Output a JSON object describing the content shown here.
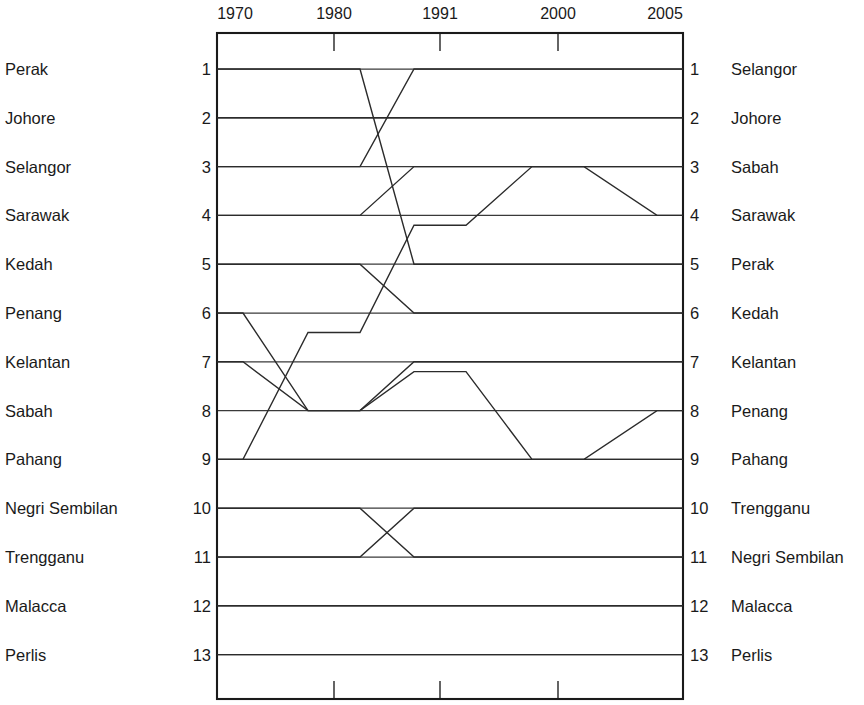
{
  "chart_data": {
    "type": "line",
    "subtype": "bump-rank-slopegraph",
    "title": "",
    "xlabel": "",
    "ylabel": "",
    "grid": true,
    "legend_position": "axis-labels-both-sides",
    "x": [
      1970,
      1980,
      1991,
      2000,
      2005
    ],
    "x_tick_labels": [
      "1970",
      "1980",
      "1991",
      "2000",
      "2005"
    ],
    "y_axis_inverted": true,
    "ylim": [
      1,
      13
    ],
    "rank_ticks": [
      1,
      2,
      3,
      4,
      5,
      6,
      7,
      8,
      9,
      10,
      11,
      12,
      13
    ],
    "left_axis": {
      "header": "",
      "entries": [
        {
          "rank": "1",
          "label": "Perak"
        },
        {
          "rank": "2",
          "label": "Johore"
        },
        {
          "rank": "3",
          "label": "Selangor"
        },
        {
          "rank": "4",
          "label": "Sarawak"
        },
        {
          "rank": "5",
          "label": "Kedah"
        },
        {
          "rank": "6",
          "label": "Penang"
        },
        {
          "rank": "7",
          "label": "Kelantan"
        },
        {
          "rank": "8",
          "label": "Sabah"
        },
        {
          "rank": "9",
          "label": "Pahang"
        },
        {
          "rank": "10",
          "label": "Negri Sembilan"
        },
        {
          "rank": "11",
          "label": "Trengganu"
        },
        {
          "rank": "12",
          "label": "Malacca"
        },
        {
          "rank": "13",
          "label": "Perlis"
        }
      ]
    },
    "right_axis": {
      "header": "",
      "entries": [
        {
          "rank": "1",
          "label": "Selangor"
        },
        {
          "rank": "2",
          "label": "Johore"
        },
        {
          "rank": "3",
          "label": "Sabah"
        },
        {
          "rank": "4",
          "label": "Sarawak"
        },
        {
          "rank": "5",
          "label": "Perak"
        },
        {
          "rank": "6",
          "label": "Kedah"
        },
        {
          "rank": "7",
          "label": "Kelantan"
        },
        {
          "rank": "8",
          "label": "Penang"
        },
        {
          "rank": "9",
          "label": "Pahang"
        },
        {
          "rank": "10",
          "label": "Trengganu"
        },
        {
          "rank": "11",
          "label": "Negri Sembilan"
        },
        {
          "rank": "12",
          "label": "Malacca"
        },
        {
          "rank": "13",
          "label": "Perlis"
        }
      ]
    },
    "series": [
      {
        "name": "Perak",
        "values": [
          1,
          1,
          5,
          5,
          5
        ]
      },
      {
        "name": "Johore",
        "values": [
          2,
          2,
          2,
          2,
          2
        ]
      },
      {
        "name": "Selangor",
        "values": [
          3,
          3,
          1,
          1,
          1
        ]
      },
      {
        "name": "Sarawak",
        "values": [
          4,
          4,
          3,
          3,
          4
        ]
      },
      {
        "name": "Kedah",
        "values": [
          5,
          5,
          6,
          6,
          6
        ]
      },
      {
        "name": "Penang",
        "values": [
          6,
          8,
          7.2,
          9,
          8
        ]
      },
      {
        "name": "Kelantan",
        "values": [
          7,
          8,
          7,
          7,
          7
        ]
      },
      {
        "name": "Sabah",
        "values": [
          9,
          6.4,
          4.2,
          3,
          3
        ]
      },
      {
        "name": "Pahang",
        "values": [
          9,
          9,
          9,
          9,
          9
        ]
      },
      {
        "name": "Negri Sembilan",
        "values": [
          10,
          10,
          11,
          11,
          11
        ]
      },
      {
        "name": "Trengganu",
        "values": [
          11,
          11,
          10,
          10,
          10
        ]
      },
      {
        "name": "Malacca",
        "values": [
          12,
          12,
          12,
          12,
          12
        ]
      },
      {
        "name": "Perlis",
        "values": [
          13,
          13,
          13,
          13,
          13
        ]
      }
    ],
    "colors": {
      "line": "#2b2b2b",
      "frame": "#1a1a1a",
      "grid": "#3a3a3a",
      "background": "#ffffff"
    }
  }
}
